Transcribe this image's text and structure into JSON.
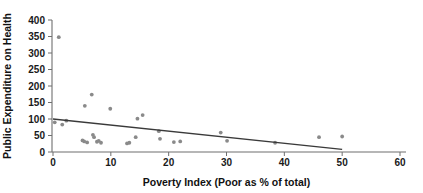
{
  "chart_data": {
    "type": "scatter",
    "title": "",
    "xlabel": "Poverty Index (Poor as % of total)",
    "ylabel": "Public Expenditure on Health",
    "xlim": [
      0,
      60
    ],
    "ylim": [
      0,
      400
    ],
    "xticks": [
      0,
      10,
      20,
      30,
      40,
      50,
      60
    ],
    "yticks": [
      0,
      50,
      100,
      150,
      200,
      250,
      300,
      350,
      400
    ],
    "grid": false,
    "legend": null,
    "marker_color": "#8a8a8a",
    "trendline_color": "#3a3a3a",
    "points": [
      {
        "x": 0.3,
        "y": 90
      },
      {
        "x": 1.0,
        "y": 348
      },
      {
        "x": 1.6,
        "y": 83
      },
      {
        "x": 2.3,
        "y": 95
      },
      {
        "x": 5.1,
        "y": 35
      },
      {
        "x": 5.4,
        "y": 32
      },
      {
        "x": 5.5,
        "y": 140
      },
      {
        "x": 5.9,
        "y": 29
      },
      {
        "x": 6.7,
        "y": 174
      },
      {
        "x": 6.9,
        "y": 52
      },
      {
        "x": 7.1,
        "y": 45
      },
      {
        "x": 7.6,
        "y": 31
      },
      {
        "x": 7.9,
        "y": 34
      },
      {
        "x": 8.3,
        "y": 28
      },
      {
        "x": 9.9,
        "y": 131
      },
      {
        "x": 12.8,
        "y": 26
      },
      {
        "x": 13.2,
        "y": 28
      },
      {
        "x": 14.3,
        "y": 45
      },
      {
        "x": 14.6,
        "y": 101
      },
      {
        "x": 15.5,
        "y": 112
      },
      {
        "x": 18.3,
        "y": 63
      },
      {
        "x": 18.5,
        "y": 40
      },
      {
        "x": 20.9,
        "y": 30
      },
      {
        "x": 22.0,
        "y": 32
      },
      {
        "x": 29.0,
        "y": 59
      },
      {
        "x": 30.1,
        "y": 34
      },
      {
        "x": 38.4,
        "y": 28
      },
      {
        "x": 46.0,
        "y": 45
      },
      {
        "x": 50.0,
        "y": 47
      }
    ],
    "trendline": {
      "x_start": 0,
      "y_start": 100,
      "x_end": 50,
      "y_end": 8
    }
  }
}
